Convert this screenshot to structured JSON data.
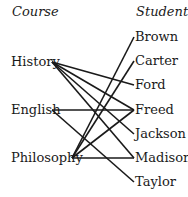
{
  "headers": {
    "left": "Course",
    "right": "Student"
  },
  "courses": [
    {
      "label": "History",
      "x": 52,
      "y": 62
    },
    {
      "label": "English",
      "x": 52,
      "y": 110
    },
    {
      "label": "Philosophy",
      "x": 72,
      "y": 158
    }
  ],
  "students": [
    {
      "label": "Brown",
      "x": 134,
      "y": 37
    },
    {
      "label": "Carter",
      "x": 134,
      "y": 61
    },
    {
      "label": "Ford",
      "x": 134,
      "y": 85
    },
    {
      "label": "Freed",
      "x": 134,
      "y": 110
    },
    {
      "label": "Jackson",
      "x": 134,
      "y": 134
    },
    {
      "label": "Madison",
      "x": 134,
      "y": 158
    },
    {
      "label": "Taylor",
      "x": 134,
      "y": 182
    }
  ],
  "edges": [
    [
      "History",
      "Ford"
    ],
    [
      "History",
      "Freed"
    ],
    [
      "History",
      "Jackson"
    ],
    [
      "History",
      "Madison"
    ],
    [
      "English",
      "Freed"
    ],
    [
      "English",
      "Taylor"
    ],
    [
      "Philosophy",
      "Brown"
    ],
    [
      "Philosophy",
      "Carter"
    ],
    [
      "Philosophy",
      "Freed"
    ],
    [
      "Philosophy",
      "Madison"
    ]
  ]
}
